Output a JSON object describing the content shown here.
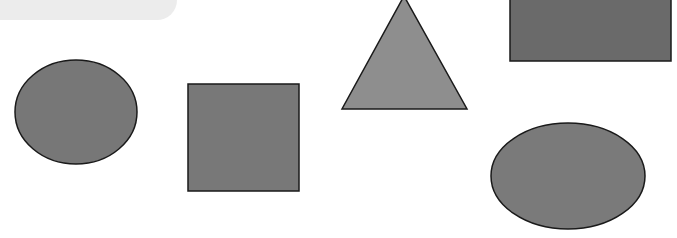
{
  "canvas": {
    "width": 677,
    "height": 238,
    "background": "#ffffff",
    "stroke_color": "#1a1a1a",
    "stroke_width": 1.5
  },
  "top_panel": {
    "color": "#ececec"
  },
  "shapes": [
    {
      "name": "circle",
      "kind": "ellipse",
      "cx": 76,
      "cy": 112,
      "rx": 61,
      "ry": 52,
      "fill": "#777777"
    },
    {
      "name": "square",
      "kind": "rect",
      "x": 188,
      "y": 84,
      "width": 111,
      "height": 107,
      "fill": "#787878"
    },
    {
      "name": "triangle",
      "kind": "polygon",
      "points": "404,-4 342,109 467,109",
      "fill": "#8e8e8e"
    },
    {
      "name": "rectangle",
      "kind": "rect",
      "x": 510,
      "y": -3,
      "width": 161,
      "height": 64,
      "fill": "#6a6a6a"
    },
    {
      "name": "ellipse",
      "kind": "ellipse",
      "cx": 568,
      "cy": 176,
      "rx": 77,
      "ry": 53,
      "fill": "#7a7a7a"
    }
  ]
}
